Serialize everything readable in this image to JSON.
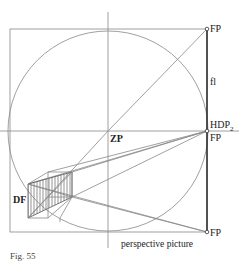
{
  "labels": {
    "fp_top": "FP",
    "fl": "fl",
    "hdp": "HDP",
    "hdp_sub": "2",
    "fp_mid": "FP",
    "zp": "ZP",
    "df": "DF",
    "fp_bottom": "FP",
    "perspective_picture": "perspective picture",
    "caption": "Fig. 55"
  },
  "colors": {
    "line": "#888888",
    "dark_line": "#333333",
    "hatch": "#777777",
    "text": "#222222"
  }
}
